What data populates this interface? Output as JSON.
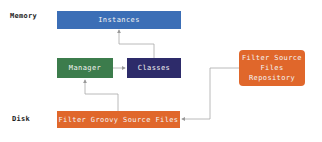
{
  "layers": {
    "memory": "Memory",
    "disk": "Disk"
  },
  "nodes": {
    "instances": {
      "label": "Instances",
      "color": "#3b6eb6"
    },
    "manager": {
      "label": "Manager",
      "color": "#3c7c4c"
    },
    "classes": {
      "label": "Classes",
      "color": "#2d2b6a"
    },
    "filter_groovy": {
      "label": "Filter Groovy Source Files",
      "color": "#e0672b"
    },
    "repository": {
      "label": "Filter Source Files Repository",
      "line1": "Filter Source",
      "line2": "Files",
      "line3": "Repository",
      "color": "#e0672b"
    }
  },
  "edges": [
    {
      "from": "classes",
      "to": "instances"
    },
    {
      "from": "manager",
      "to": "classes"
    },
    {
      "from": "filter_groovy",
      "to": "manager"
    },
    {
      "from": "repository",
      "to": "filter_groovy"
    }
  ],
  "connector_color": "#9a9a9a"
}
